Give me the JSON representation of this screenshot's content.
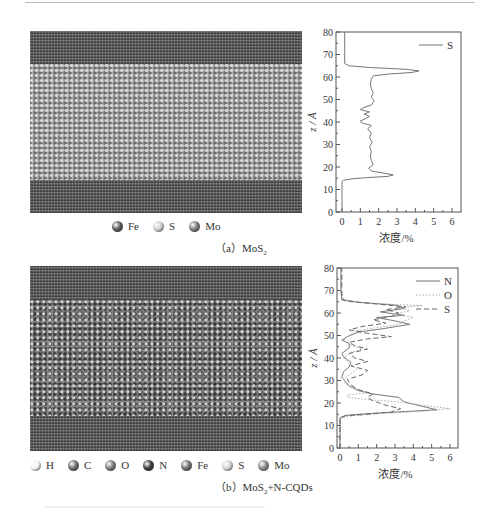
{
  "figure": {
    "panel_a": {
      "caption_prefix": "（a）",
      "caption_main": "MoS",
      "caption_sub": "2",
      "caption_suffix": "",
      "legend": [
        {
          "label": "Fe",
          "color": "#5a5a5a",
          "icon": "atom-ball-icon"
        },
        {
          "label": "S",
          "color": "#cfcfcf",
          "icon": "atom-ball-icon"
        },
        {
          "label": "Mo",
          "color": "#7a7a7a",
          "icon": "atom-ball-icon"
        }
      ]
    },
    "panel_b": {
      "caption_prefix": "（b）",
      "caption_main": "MoS",
      "caption_sub": "2",
      "caption_suffix": "+N-CQDs",
      "legend": [
        {
          "label": "H",
          "color": "#f2f2f2",
          "icon": "atom-ball-icon"
        },
        {
          "label": "C",
          "color": "#6a6a6a",
          "icon": "atom-ball-icon"
        },
        {
          "label": "O",
          "color": "#7c7c7c",
          "icon": "atom-ball-icon"
        },
        {
          "label": "N",
          "color": "#3a3a3a",
          "icon": "atom-ball-icon"
        },
        {
          "label": "Fe",
          "color": "#6e6e6e",
          "icon": "atom-ball-icon"
        },
        {
          "label": "S",
          "color": "#d4d4d4",
          "icon": "atom-ball-icon"
        },
        {
          "label": "Mo",
          "color": "#8a8a8a",
          "icon": "atom-ball-icon"
        }
      ]
    }
  },
  "chart_data": [
    {
      "type": "line",
      "title": "",
      "xlabel": "浓度/%",
      "ylabel": "z / Å",
      "xlim": [
        0,
        6.5
      ],
      "ylim": [
        0,
        80
      ],
      "xticks": [
        0,
        1,
        2,
        3,
        4,
        5,
        6
      ],
      "yticks": [
        0,
        10,
        20,
        30,
        40,
        50,
        60,
        70,
        80
      ],
      "grid": false,
      "legend_position": "upper right",
      "series": [
        {
          "name": "S",
          "style": "solid",
          "points": [
            [
              0.0,
              0
            ],
            [
              0.0,
              13.5
            ],
            [
              0.1,
              14.2
            ],
            [
              0.6,
              14.8
            ],
            [
              1.4,
              15.3
            ],
            [
              2.5,
              15.8
            ],
            [
              2.8,
              16.5
            ],
            [
              2.2,
              17.4
            ],
            [
              1.6,
              18.2
            ],
            [
              1.45,
              19.5
            ],
            [
              1.7,
              21
            ],
            [
              1.6,
              23
            ],
            [
              1.55,
              25
            ],
            [
              1.6,
              27
            ],
            [
              1.5,
              29
            ],
            [
              1.65,
              31
            ],
            [
              1.5,
              33
            ],
            [
              1.6,
              35
            ],
            [
              1.4,
              37
            ],
            [
              1.6,
              38.5
            ],
            [
              1.1,
              39.5
            ],
            [
              1.0,
              40.5
            ],
            [
              1.3,
              41.5
            ],
            [
              1.5,
              42.5
            ],
            [
              1.2,
              43.5
            ],
            [
              1.5,
              44.5
            ],
            [
              1.0,
              45.5
            ],
            [
              1.2,
              46.5
            ],
            [
              1.6,
              47.5
            ],
            [
              1.75,
              49.5
            ],
            [
              1.6,
              51
            ],
            [
              1.7,
              53
            ],
            [
              1.6,
              55
            ],
            [
              1.55,
              57
            ],
            [
              1.6,
              59
            ],
            [
              1.7,
              60.5
            ],
            [
              2.5,
              61.3
            ],
            [
              3.8,
              62
            ],
            [
              4.2,
              62.7
            ],
            [
              3.5,
              63.4
            ],
            [
              1.5,
              64.2
            ],
            [
              0.4,
              65
            ],
            [
              0.15,
              66
            ],
            [
              0.15,
              70
            ],
            [
              0.15,
              80
            ]
          ]
        }
      ]
    },
    {
      "type": "line",
      "title": "",
      "xlabel": "浓度/%",
      "ylabel": "z / Å",
      "xlim": [
        0,
        6.5
      ],
      "ylim": [
        0,
        80
      ],
      "xticks": [
        0,
        1,
        2,
        3,
        4,
        5,
        6
      ],
      "yticks": [
        0,
        10,
        20,
        30,
        40,
        50,
        60,
        70,
        80
      ],
      "grid": false,
      "legend_position": "upper right",
      "series": [
        {
          "name": "N",
          "style": "solid",
          "points": [
            [
              0.0,
              0
            ],
            [
              0.0,
              13.5
            ],
            [
              0.3,
              14.5
            ],
            [
              1.5,
              15.3
            ],
            [
              3.5,
              16.2
            ],
            [
              5.3,
              17
            ],
            [
              4.5,
              18.5
            ],
            [
              3.5,
              20.5
            ],
            [
              3.2,
              22.5
            ],
            [
              1.8,
              24
            ],
            [
              1.0,
              25.5
            ],
            [
              0.5,
              27.5
            ],
            [
              0.3,
              29.5
            ],
            [
              0.1,
              31.5
            ],
            [
              0.2,
              34
            ],
            [
              0.5,
              36
            ],
            [
              0.6,
              38
            ],
            [
              0.2,
              40.5
            ],
            [
              0.1,
              42
            ],
            [
              0.5,
              44.5
            ],
            [
              0.5,
              46.5
            ],
            [
              0.1,
              48
            ],
            [
              0.4,
              49.5
            ],
            [
              1.0,
              51.5
            ],
            [
              2.3,
              53
            ],
            [
              3.8,
              55
            ],
            [
              3.0,
              56.5
            ],
            [
              2.0,
              58
            ],
            [
              3.5,
              59
            ],
            [
              2.2,
              60.5
            ],
            [
              3.5,
              62
            ],
            [
              3.0,
              63.5
            ],
            [
              1.0,
              64.8
            ],
            [
              0.1,
              66
            ],
            [
              0.05,
              70
            ],
            [
              0.05,
              80
            ]
          ]
        },
        {
          "name": "O",
          "style": "dotted",
          "points": [
            [
              0.0,
              0
            ],
            [
              0.0,
              13.0
            ],
            [
              0.3,
              14
            ],
            [
              2.0,
              15.2
            ],
            [
              4.5,
              16.3
            ],
            [
              6.0,
              17.5
            ],
            [
              4.5,
              19
            ],
            [
              3.2,
              20.5
            ],
            [
              1.5,
              21.5
            ],
            [
              0.4,
              22.5
            ],
            [
              0.4,
              23.5
            ],
            [
              1.5,
              24.5
            ],
            [
              0.8,
              26.5
            ],
            [
              0.3,
              28.5
            ],
            [
              0.2,
              30.5
            ],
            [
              0.5,
              32.5
            ],
            [
              0.9,
              35
            ],
            [
              0.5,
              37.5
            ],
            [
              0.2,
              40
            ],
            [
              0.6,
              42.5
            ],
            [
              1.2,
              44
            ],
            [
              0.5,
              46
            ],
            [
              0.2,
              48
            ],
            [
              0.5,
              50
            ],
            [
              0.8,
              52
            ],
            [
              2.0,
              53.5
            ],
            [
              3.2,
              55
            ],
            [
              3.5,
              56.5
            ],
            [
              4.0,
              58
            ],
            [
              3.0,
              59.5
            ],
            [
              3.8,
              61
            ],
            [
              3.2,
              62.5
            ],
            [
              4.5,
              63.3
            ],
            [
              1.5,
              64.3
            ],
            [
              0.2,
              65.5
            ],
            [
              0.1,
              70
            ],
            [
              0.1,
              80
            ]
          ]
        },
        {
          "name": "S",
          "style": "dashed",
          "points": [
            [
              0.0,
              0
            ],
            [
              0.0,
              13.2
            ],
            [
              0.3,
              14.3
            ],
            [
              1.5,
              15.0
            ],
            [
              2.8,
              16
            ],
            [
              3.3,
              17.5
            ],
            [
              2.5,
              19
            ],
            [
              1.8,
              21
            ],
            [
              1.5,
              22.5
            ],
            [
              1.8,
              24
            ],
            [
              1.0,
              26
            ],
            [
              0.6,
              28
            ],
            [
              0.4,
              30.5
            ],
            [
              1.2,
              32.5
            ],
            [
              1.5,
              34.5
            ],
            [
              0.6,
              36.5
            ],
            [
              1.5,
              38.5
            ],
            [
              0.8,
              40
            ],
            [
              0.5,
              42
            ],
            [
              1.5,
              44
            ],
            [
              0.8,
              45.5
            ],
            [
              0.5,
              47
            ],
            [
              1.5,
              48.5
            ],
            [
              2.8,
              49.5
            ],
            [
              1.5,
              51
            ],
            [
              0.5,
              52.5
            ],
            [
              1.2,
              54
            ],
            [
              2.5,
              55.5
            ],
            [
              1.8,
              57
            ],
            [
              2.8,
              58.5
            ],
            [
              3.2,
              60
            ],
            [
              2.5,
              61.5
            ],
            [
              3.6,
              62.7
            ],
            [
              2.0,
              64
            ],
            [
              0.4,
              65.2
            ],
            [
              0.1,
              66
            ],
            [
              0.1,
              70
            ],
            [
              0.1,
              80
            ]
          ]
        }
      ]
    }
  ]
}
